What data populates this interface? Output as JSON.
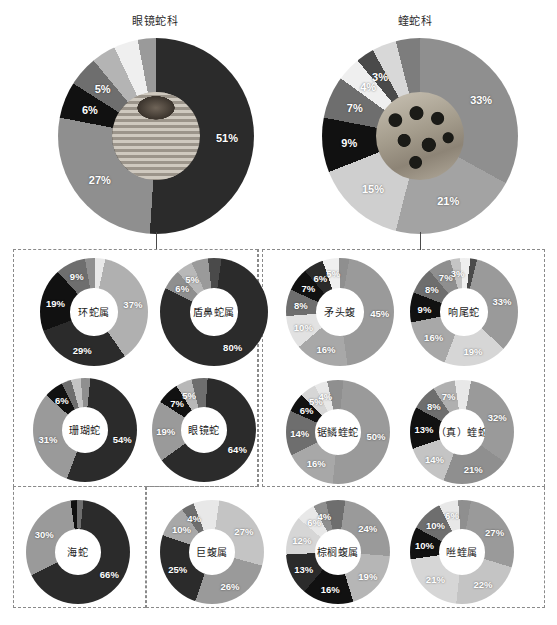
{
  "figure": {
    "background": "#ffffff",
    "palette": {
      "s1": "#2b2b2b",
      "s2": "#8f8f8f",
      "s3": "#c9c9c9",
      "s4": "#5e5e5e",
      "s5": "#ededed",
      "s6": "#111111",
      "s7": "#a8a8a8",
      "s8": "#7a7a7a",
      "s9": "#dcdcdc"
    },
    "dash_border": "#8a8a8a"
  },
  "top_charts": [
    {
      "id": "elapidae",
      "title": "眼镜蛇科",
      "center_image": "cobra-photo",
      "chart_data": {
        "type": "pie",
        "title": "眼镜蛇科",
        "categories": [
          "51%",
          "27%",
          "6%",
          "5%",
          "sliver-a",
          "sliver-b",
          "sliver-c"
        ],
        "values": [
          51,
          27,
          6,
          5,
          4,
          4,
          3
        ],
        "labels": [
          "51%",
          "27%",
          "6%",
          "5%",
          "",
          "",
          ""
        ],
        "colors": [
          "#2b2b2b",
          "#8f8f8f",
          "#111111",
          "#6e6e6e",
          "#b4b4b4",
          "#efefef",
          "#9a9a9a"
        ]
      }
    },
    {
      "id": "viperidae",
      "title": "蝰蛇科",
      "center_image": "viper-photo",
      "chart_data": {
        "type": "pie",
        "title": "蝰蛇科",
        "categories": [
          "33%",
          "21%",
          "15%",
          "9%",
          "7%",
          "4%",
          "3%",
          "sliver-a",
          "sliver-b"
        ],
        "values": [
          33,
          21,
          15,
          9,
          7,
          4,
          3,
          4,
          4
        ],
        "labels": [
          "33%",
          "21%",
          "15%",
          "9%",
          "7%",
          "4%",
          "3%",
          "",
          ""
        ],
        "colors": [
          "#8f8f8f",
          "#a3a3a3",
          "#cfcfcf",
          "#111111",
          "#6e6e6e",
          "#efefef",
          "#4a4a4a",
          "#d8d8d8",
          "#7d7d7d"
        ]
      }
    }
  ],
  "groups": [
    {
      "id": "elapidae-group",
      "charts": [
        {
          "id": "bungarus",
          "center_label": "环蛇属",
          "chart_data": {
            "type": "pie",
            "title": "环蛇属",
            "categories": [
              "37%",
              "29%",
              "19%",
              "9%",
              "sliver-a",
              "sliver-b"
            ],
            "values": [
              37,
              29,
              19,
              9,
              3,
              3
            ],
            "labels": [
              "37%",
              "29%",
              "19%",
              "9%",
              "",
              ""
            ],
            "colors": [
              "#b0b0b0",
              "#2b2b2b",
              "#111111",
              "#6e6e6e",
              "#8f8f8f",
              "#e8e8e8"
            ]
          }
        },
        {
          "id": "aspidelaps",
          "center_label": "盾鼻蛇属",
          "chart_data": {
            "type": "pie",
            "title": "盾鼻蛇属",
            "categories": [
              "80%",
              "6%",
              "5%",
              "sliver-a",
              "sliver-b"
            ],
            "values": [
              80,
              6,
              5,
              5,
              4
            ],
            "labels": [
              "80%",
              "6%",
              "5%",
              "",
              ""
            ],
            "colors": [
              "#2b2b2b",
              "#8f8f8f",
              "#b8b8b8",
              "#9a9a9a",
              "#4a4a4a"
            ]
          }
        },
        {
          "id": "coral-snake",
          "center_label": "珊瑚蛇",
          "chart_data": {
            "type": "pie",
            "title": "珊瑚蛇",
            "categories": [
              "54%",
              "31%",
              "6%",
              "sliver-a",
              "sliver-b",
              "sliver-c"
            ],
            "values": [
              54,
              31,
              6,
              3,
              3,
              3
            ],
            "labels": [
              "54%",
              "31%",
              "6%",
              "",
              "",
              ""
            ],
            "colors": [
              "#2b2b2b",
              "#9a9a9a",
              "#111111",
              "#6e6e6e",
              "#c4c4c4",
              "#8f8f8f"
            ]
          }
        },
        {
          "id": "cobra",
          "center_label": "眼镜蛇",
          "chart_data": {
            "type": "pie",
            "title": "眼镜蛇",
            "categories": [
              "64%",
              "19%",
              "7%",
              "5%",
              "sliver-a"
            ],
            "values": [
              64,
              19,
              7,
              5,
              5
            ],
            "labels": [
              "64%",
              "19%",
              "7%",
              "5%",
              ""
            ],
            "colors": [
              "#2b2b2b",
              "#9a9a9a",
              "#111111",
              "#b8b8b8",
              "#6e6e6e"
            ]
          }
        },
        {
          "id": "sea-snake",
          "center_label": "海蛇",
          "chart_data": {
            "type": "pie",
            "title": "海蛇",
            "categories": [
              "66%",
              "30%",
              "sliver-a",
              "sliver-b"
            ],
            "values": [
              66,
              30,
              2,
              2
            ],
            "labels": [
              "66%",
              "30%",
              "",
              ""
            ],
            "colors": [
              "#2b2b2b",
              "#9a9a9a",
              "#111111",
              "#6e6e6e"
            ]
          }
        }
      ]
    },
    {
      "id": "viperidae-group",
      "charts": [
        {
          "id": "bothrops",
          "center_label": "矛头蝮",
          "chart_data": {
            "type": "pie",
            "title": "矛头蝮",
            "categories": [
              "45%",
              "16%",
              "10%",
              "8%",
              "7%",
              "6%",
              "5%",
              "sliver-a"
            ],
            "values": [
              45,
              16,
              10,
              8,
              7,
              6,
              5,
              3
            ],
            "labels": [
              "45%",
              "16%",
              "10%",
              "8%",
              "7%",
              "6%",
              "5%",
              ""
            ],
            "colors": [
              "#9a9a9a",
              "#a8a8a8",
              "#e2e2e2",
              "#6e6e6e",
              "#111111",
              "#2b2b2b",
              "#efefef",
              "#8f8f8f"
            ]
          }
        },
        {
          "id": "rattlesnake",
          "center_label": "响尾蛇",
          "chart_data": {
            "type": "pie",
            "title": "响尾蛇",
            "categories": [
              "33%",
              "19%",
              "16%",
              "9%",
              "8%",
              "7%",
              "3%",
              "sliver-a",
              "sliver-b"
            ],
            "values": [
              33,
              19,
              16,
              9,
              8,
              7,
              3,
              3,
              2
            ],
            "labels": [
              "33%",
              "19%",
              "16%",
              "9%",
              "8%",
              "7%",
              "3%",
              "",
              ""
            ],
            "colors": [
              "#9a9a9a",
              "#d6d6d6",
              "#a8a8a8",
              "#111111",
              "#6e6e6e",
              "#8f8f8f",
              "#c4c4c4",
              "#efefef",
              "#4a4a4a"
            ]
          }
        },
        {
          "id": "echis",
          "center_label": "锯鳞蝰蛇",
          "chart_data": {
            "type": "pie",
            "title": "锯鳞蝰蛇",
            "categories": [
              "50%",
              "16%",
              "14%",
              "6%",
              "5%",
              "4%",
              "sliver-a"
            ],
            "values": [
              50,
              16,
              14,
              6,
              5,
              4,
              5
            ],
            "labels": [
              "50%",
              "16%",
              "14%",
              "6%",
              "5%",
              "4%",
              ""
            ],
            "colors": [
              "#9a9a9a",
              "#a8a8a8",
              "#6e6e6e",
              "#111111",
              "#d6d6d6",
              "#e8e8e8",
              "#8f8f8f"
            ]
          }
        },
        {
          "id": "true-viper",
          "center_label": "（真）蝰蛇",
          "chart_data": {
            "type": "pie",
            "title": "（真）蝰蛇",
            "categories": [
              "32%",
              "21%",
              "14%",
              "13%",
              "8%",
              "7%",
              "sliver-a"
            ],
            "values": [
              32,
              21,
              14,
              13,
              8,
              7,
              5
            ],
            "labels": [
              "32%",
              "21%",
              "14%",
              "13%",
              "8%",
              "7%",
              ""
            ],
            "colors": [
              "#9a9a9a",
              "#8f8f8f",
              "#c4c4c4",
              "#111111",
              "#6e6e6e",
              "#b0b0b0",
              "#e8e8e8"
            ]
          }
        },
        {
          "id": "bothriechis",
          "center_label": "棕榈蝮属",
          "chart_data": {
            "type": "pie",
            "title": "棕榈蝮属",
            "categories": [
              "24%",
              "19%",
              "16%",
              "13%",
              "12%",
              "6%",
              "4%",
              "sliver-a"
            ],
            "values": [
              24,
              19,
              16,
              13,
              12,
              6,
              4,
              6
            ],
            "labels": [
              "24%",
              "19%",
              "16%",
              "13%",
              "12%",
              "6%",
              "4%",
              ""
            ],
            "colors": [
              "#9a9a9a",
              "#b6b6b6",
              "#111111",
              "#2b2b2b",
              "#d6d6d6",
              "#e8e8e8",
              "#8f8f8f",
              "#6e6e6e"
            ]
          }
        },
        {
          "id": "bitis",
          "center_label": "咝蝰属",
          "chart_data": {
            "type": "pie",
            "title": "咝蝰属",
            "categories": [
              "27%",
              "22%",
              "21%",
              "10%",
              "10%",
              "6%",
              "sliver-a"
            ],
            "values": [
              27,
              22,
              21,
              10,
              10,
              6,
              4
            ],
            "labels": [
              "27%",
              "22%",
              "21%",
              "10%",
              "10%",
              "6%",
              ""
            ],
            "colors": [
              "#9a9a9a",
              "#c4c4c4",
              "#d6d6d6",
              "#111111",
              "#6e6e6e",
              "#e8e8e8",
              "#8f8f8f"
            ]
          }
        }
      ]
    }
  ]
}
